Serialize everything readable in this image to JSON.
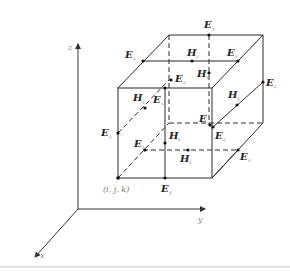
{
  "figure": {
    "axes": {
      "x": "x",
      "y": "y",
      "z": "z"
    },
    "origin_label": "(i, j, k)",
    "labels": [
      {
        "id": "e-top-back",
        "symbol": "E",
        "sub": "y"
      },
      {
        "id": "e-top-left",
        "symbol": "E",
        "sub": "x"
      },
      {
        "id": "h-top",
        "symbol": "H",
        "sub": "z"
      },
      {
        "id": "e-top-right",
        "symbol": "E",
        "sub": "x"
      },
      {
        "id": "h-back",
        "symbol": "H",
        "sub": "x"
      },
      {
        "id": "e-mid-z",
        "symbol": "E",
        "sub": "z"
      },
      {
        "id": "e-right-far",
        "symbol": "E",
        "sub": "z"
      },
      {
        "id": "h-left",
        "symbol": "H",
        "sub": "y"
      },
      {
        "id": "e-left-diag",
        "symbol": "E",
        "sub": "x"
      },
      {
        "id": "h-right",
        "symbol": "H",
        "sub": "y"
      },
      {
        "id": "e-left-z",
        "symbol": "E",
        "sub": "z"
      },
      {
        "id": "e-front-y",
        "symbol": "E",
        "sub": "y"
      },
      {
        "id": "e-right-z",
        "symbol": "E",
        "sub": "z"
      },
      {
        "id": "e-bottom-x",
        "symbol": "E",
        "sub": "x"
      },
      {
        "id": "h-front",
        "symbol": "H",
        "sub": "x"
      },
      {
        "id": "h-bottom",
        "symbol": "H",
        "sub": "z"
      },
      {
        "id": "e-bottom-right",
        "symbol": "E",
        "sub": "x"
      },
      {
        "id": "e-bottom-y",
        "symbol": "E",
        "sub": "y"
      }
    ]
  }
}
